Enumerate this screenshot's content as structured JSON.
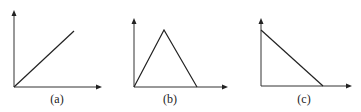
{
  "figure": {
    "panels": [
      {
        "id": "a",
        "label": "(a)",
        "shape": "increasing-line",
        "axes": {
          "origin": [
            14,
            87
          ],
          "y_top": 10,
          "x_end": 102
        },
        "points": [
          [
            14,
            87
          ],
          [
            74,
            31
          ]
        ],
        "label_x": 57
      },
      {
        "id": "b",
        "label": "(b)",
        "shape": "triangle",
        "axes": {
          "origin": [
            134,
            87
          ],
          "y_top": 18,
          "x_end": 228
        },
        "points": [
          [
            134,
            87
          ],
          [
            164,
            30
          ],
          [
            197,
            87
          ]
        ],
        "label_x": 170
      },
      {
        "id": "c",
        "label": "(c)",
        "shape": "decreasing-line",
        "axes": {
          "origin": [
            261,
            86
          ],
          "y_top": 18,
          "x_end": 352
        },
        "points": [
          [
            261,
            30
          ],
          [
            323,
            86
          ]
        ],
        "label_x": 304
      }
    ],
    "colors": {
      "line": "#222222",
      "axis": "#333333",
      "background": "#ffffff"
    }
  }
}
